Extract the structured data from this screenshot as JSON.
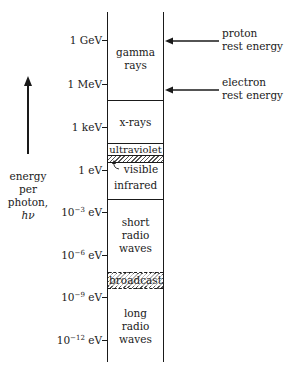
{
  "axis": {
    "arrow_icon": "up-arrow",
    "label_lines": [
      "energy",
      "per",
      "photon,",
      "hν"
    ]
  },
  "ticks": [
    {
      "mantissa": "1",
      "exp": "",
      "unit": "GeV",
      "y": 40
    },
    {
      "mantissa": "1",
      "exp": "",
      "unit": "MeV",
      "y": 84
    },
    {
      "mantissa": "1",
      "exp": "",
      "unit": "keV",
      "y": 127
    },
    {
      "mantissa": "1",
      "exp": "",
      "unit": "eV",
      "y": 170
    },
    {
      "mantissa": "10",
      "exp": "−3",
      "unit": "eV",
      "y": 212
    },
    {
      "mantissa": "10",
      "exp": "−6",
      "unit": "eV",
      "y": 255
    },
    {
      "mantissa": "10",
      "exp": "−9",
      "unit": "eV",
      "y": 297
    },
    {
      "mantissa": "10",
      "exp": "−12",
      "unit": "eV",
      "y": 340
    }
  ],
  "bands": [
    {
      "label_lines": [
        "gamma",
        "rays"
      ],
      "top": 12,
      "bottom": 100
    },
    {
      "label_lines": [
        "x-rays"
      ],
      "top": 100,
      "bottom": 143
    },
    {
      "label_lines": [
        "ultraviolet"
      ],
      "top": 143,
      "bottom": 155
    },
    {
      "label_lines": [
        "visible"
      ],
      "top": 155,
      "bottom": 162,
      "hatched": true
    },
    {
      "label_lines": [
        "infrared"
      ],
      "top": 162,
      "bottom": 199
    },
    {
      "label_lines": [
        "short",
        "radio",
        "waves"
      ],
      "top": 199,
      "bottom": 272
    },
    {
      "label_lines": [
        "broadcast"
      ],
      "top": 272,
      "bottom": 289,
      "hatched": true
    },
    {
      "label_lines": [
        "long",
        "radio",
        "waves"
      ],
      "top": 289,
      "bottom": 362
    }
  ],
  "labels": {
    "gamma": [
      "gamma",
      "rays"
    ],
    "xrays": "x-rays",
    "ultraviolet": "ultraviolet",
    "visible": "visible",
    "infrared": "infrared",
    "short_radio": [
      "short",
      "radio",
      "waves"
    ],
    "broadcast": "broadcast",
    "long_radio": [
      "long",
      "radio",
      "waves"
    ]
  },
  "annotations": [
    {
      "lines": [
        "proton",
        "rest energy"
      ],
      "arrow_y": 41
    },
    {
      "lines": [
        "electron",
        "rest energy"
      ],
      "arrow_y": 89
    }
  ]
}
